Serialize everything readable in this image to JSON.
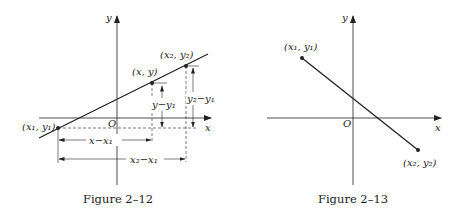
{
  "figures": [
    {
      "id": "fig-2-12",
      "caption": "Figure 2–12",
      "axes": {
        "x_label": "x",
        "y_label": "y",
        "origin_label": "O"
      },
      "points": [
        {
          "name": "P1",
          "label": "(x₁, y₁)"
        },
        {
          "name": "P",
          "label": "(x, y)"
        },
        {
          "name": "P2",
          "label": "(x₂, y₂)"
        }
      ],
      "dimensions": {
        "dx_partial": "x−x₁",
        "dx_total": "x₂−x₁",
        "dy_partial": "y−y₁",
        "dy_total": "y₂−y₁"
      }
    },
    {
      "id": "fig-2-13",
      "caption": "Figure 2–13",
      "axes": {
        "x_label": "x",
        "y_label": "y",
        "origin_label": "O"
      },
      "points": [
        {
          "name": "P1",
          "label": "(x₁, y₁)"
        },
        {
          "name": "P2",
          "label": "(x₂, y₂)"
        }
      ]
    }
  ],
  "colors": {
    "ink": "#222222",
    "background": "#ffffff"
  }
}
